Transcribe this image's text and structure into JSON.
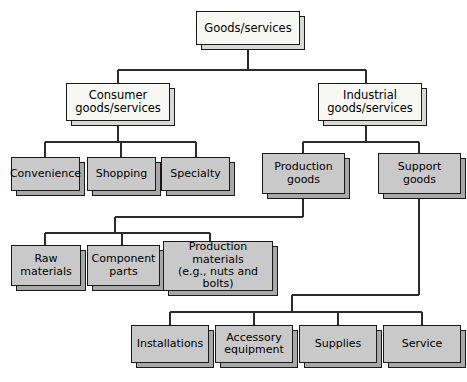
{
  "diagram": {
    "type": "tree",
    "colors": {
      "white_box_fill": "#f7f7f4",
      "gray_box_fill": "#c9c9c9",
      "border": "#1a1a1a",
      "shadow_gray": "#a8a8a8",
      "shadow_light": "#d8d8d6",
      "connector": "#2b2b2b",
      "background": "#ffffff"
    },
    "nodes": [
      {
        "id": "root",
        "label": "Goods/services",
        "style": "white",
        "level": 0,
        "x": 196,
        "y": 11,
        "w": 104,
        "h": 34,
        "font_size": 11.5
      },
      {
        "id": "consumer",
        "label": "Consumer\ngoods/services",
        "style": "white",
        "level": 1,
        "x": 66,
        "y": 83,
        "w": 104,
        "h": 38,
        "font_size": 11.5
      },
      {
        "id": "industrial",
        "label": "Industrial\ngoods/services",
        "style": "white",
        "level": 1,
        "x": 318,
        "y": 83,
        "w": 104,
        "h": 38,
        "font_size": 11.5
      },
      {
        "id": "convenience",
        "label": "Convenience",
        "style": "gray",
        "level": 2,
        "x": 11,
        "y": 157,
        "w": 69,
        "h": 34,
        "font_size": 11
      },
      {
        "id": "shopping",
        "label": "Shopping",
        "style": "gray",
        "level": 2,
        "x": 87,
        "y": 157,
        "w": 69,
        "h": 34,
        "font_size": 11
      },
      {
        "id": "specialty",
        "label": "Specialty",
        "style": "gray",
        "level": 2,
        "x": 161,
        "y": 157,
        "w": 69,
        "h": 34,
        "font_size": 11
      },
      {
        "id": "production-goods",
        "label": "Production\ngoods",
        "style": "gray",
        "level": 2,
        "x": 262,
        "y": 153,
        "w": 83,
        "h": 41,
        "font_size": 11
      },
      {
        "id": "support-goods",
        "label": "Support\ngoods",
        "style": "gray",
        "level": 2,
        "x": 378,
        "y": 153,
        "w": 83,
        "h": 41,
        "font_size": 11
      },
      {
        "id": "raw-materials",
        "label": "Raw\nmaterials",
        "style": "gray",
        "level": 3,
        "x": 11,
        "y": 245,
        "w": 70,
        "h": 41,
        "font_size": 11
      },
      {
        "id": "component-parts",
        "label": "Component\nparts",
        "style": "gray",
        "level": 3,
        "x": 87,
        "y": 245,
        "w": 73,
        "h": 41,
        "font_size": 11
      },
      {
        "id": "production-materials",
        "label": "Production\nmaterials\n(e.g., nuts and bolts)",
        "style": "gray",
        "level": 3,
        "x": 163,
        "y": 241,
        "w": 110,
        "h": 50,
        "font_size": 11
      },
      {
        "id": "installations",
        "label": "Installations",
        "style": "gray",
        "level": 3,
        "x": 131,
        "y": 325,
        "w": 78,
        "h": 38,
        "font_size": 11
      },
      {
        "id": "accessory-equipment",
        "label": "Accessory\nequipment",
        "style": "gray",
        "level": 3,
        "x": 215,
        "y": 325,
        "w": 78,
        "h": 38,
        "font_size": 11
      },
      {
        "id": "supplies",
        "label": "Supplies",
        "style": "gray",
        "level": 3,
        "x": 299,
        "y": 325,
        "w": 78,
        "h": 38,
        "font_size": 11
      },
      {
        "id": "service",
        "label": "Service",
        "style": "gray",
        "level": 3,
        "x": 383,
        "y": 325,
        "w": 78,
        "h": 38,
        "font_size": 11
      }
    ],
    "edges": [
      {
        "from": "root",
        "to": "consumer"
      },
      {
        "from": "root",
        "to": "industrial"
      },
      {
        "from": "consumer",
        "to": "convenience"
      },
      {
        "from": "consumer",
        "to": "shopping"
      },
      {
        "from": "consumer",
        "to": "specialty"
      },
      {
        "from": "industrial",
        "to": "production-goods"
      },
      {
        "from": "industrial",
        "to": "support-goods"
      },
      {
        "from": "production-goods",
        "to": "raw-materials"
      },
      {
        "from": "production-goods",
        "to": "component-parts"
      },
      {
        "from": "production-goods",
        "to": "production-materials"
      },
      {
        "from": "support-goods",
        "to": "installations"
      },
      {
        "from": "support-goods",
        "to": "accessory-equipment"
      },
      {
        "from": "support-goods",
        "to": "supplies"
      },
      {
        "from": "support-goods",
        "to": "service"
      }
    ]
  }
}
